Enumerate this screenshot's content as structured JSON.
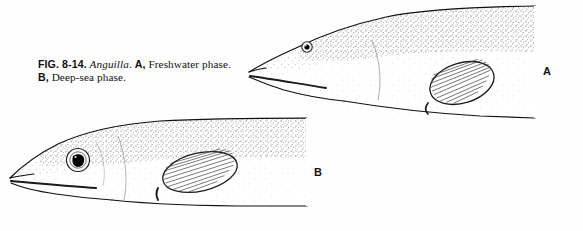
{
  "figure": {
    "number": "FIG. 8-14.",
    "genus": "Anguilla",
    "genus_period": ".",
    "part_a_letter": "A,",
    "part_a_text": " Freshwater phase.",
    "part_b_letter": "B,",
    "part_b_text": " Deep-sea phase.",
    "label_a": "A",
    "label_b": "B"
  },
  "colors": {
    "ink": "#1a1a1a",
    "outline": "#111111",
    "stipple": "#3a3a3a",
    "background": "#fefefe",
    "pupil": "#000000"
  },
  "specimens": [
    {
      "id": "specimen-a",
      "label": "A",
      "phase": "Freshwater phase",
      "eye_size": "small",
      "eye_diameter_px": 9,
      "snout": "pointed",
      "position": "upper-right"
    },
    {
      "id": "specimen-b",
      "label": "B",
      "phase": "Deep-sea phase",
      "eye_size": "enlarged",
      "eye_diameter_px": 21,
      "snout": "blunt",
      "position": "lower-left"
    }
  ]
}
